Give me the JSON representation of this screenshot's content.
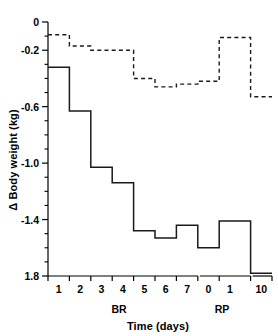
{
  "chart_data": {
    "type": "line",
    "subtype": "step",
    "title": "",
    "xlabel": "Time (days)",
    "ylabel": "Δ Body weight (kg)",
    "ylim": [
      -1.9,
      0.0
    ],
    "grid": false,
    "legend": "none",
    "y_major_ticks": [
      0,
      -0.2,
      -0.6,
      -1.0,
      -1.4,
      -1.8
    ],
    "y_tick_labels": [
      "0",
      "-0.2",
      "-0.6",
      "-1.0",
      "-1.4",
      "1.8"
    ],
    "y_minor_ticks": [
      -0.1,
      -0.3,
      -0.4,
      -0.5,
      -0.7,
      -0.8,
      -0.9,
      -1.1,
      -1.2,
      -1.3,
      -1.5,
      -1.6,
      -1.7
    ],
    "x_tick_labels": [
      "1",
      "2",
      "3",
      "4",
      "5",
      "6",
      "7",
      "0",
      "1",
      "10"
    ],
    "x_groups": [
      {
        "label": "BR",
        "ticks": [
          "1",
          "2",
          "3",
          "4",
          "5",
          "6",
          "7"
        ]
      },
      {
        "label": "RP",
        "ticks": [
          "0",
          "1",
          "10"
        ]
      }
    ],
    "axis_break": {
      "after_tick": "1",
      "before_tick": "10",
      "present": true
    },
    "series": [
      {
        "name": "solid",
        "style": "solid",
        "color": "#1a1a1a",
        "categories": [
          "1",
          "2",
          "3",
          "4",
          "5",
          "6",
          "7",
          "0",
          "1",
          "10"
        ],
        "values": [
          -0.32,
          -0.63,
          -1.03,
          -1.14,
          -1.48,
          -1.53,
          -1.44,
          -1.6,
          -1.41,
          -1.78
        ]
      },
      {
        "name": "dashed",
        "style": "dashed",
        "color": "#1a1a1a",
        "categories": [
          "1",
          "2",
          "3",
          "4",
          "5",
          "6",
          "7",
          "0",
          "1",
          "10"
        ],
        "values": [
          -0.09,
          -0.17,
          -0.2,
          -0.2,
          -0.4,
          -0.46,
          -0.44,
          -0.42,
          -0.11,
          -0.53
        ]
      }
    ]
  }
}
